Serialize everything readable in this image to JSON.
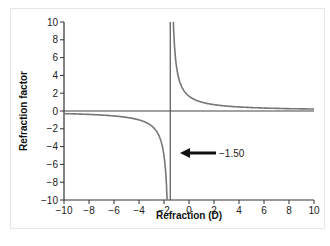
{
  "chart_data": {
    "type": "line",
    "title": "",
    "xlabel": "Refraction (D)",
    "ylabel": "Refraction factor",
    "xlim": [
      -10,
      10
    ],
    "ylim": [
      -10,
      10
    ],
    "x_ticks": [
      -10,
      -8,
      -6,
      -4,
      -2,
      0,
      2,
      4,
      6,
      8,
      10
    ],
    "y_ticks": [
      10,
      8,
      6,
      4,
      2,
      0,
      -2,
      -4,
      -6,
      -8,
      -10
    ],
    "grid": false,
    "legend": null,
    "vertical_asymptote": -1.5,
    "annotations": [
      {
        "text": "−1.50",
        "arrow_points_to_x": -1.5,
        "y": -4
      }
    ],
    "series": [
      {
        "name": "Refraction factor",
        "formula": "2.5 / (D + 1.5)",
        "x": [
          -10,
          -8,
          -6,
          -4,
          -3,
          -2.5,
          -2,
          -1.75,
          -1.25,
          -1,
          -0.5,
          0,
          1,
          2,
          4,
          6,
          8,
          10
        ],
        "values": [
          -0.29,
          -0.38,
          -0.56,
          -1.0,
          -1.67,
          -2.5,
          -5.0,
          -10.0,
          10.0,
          5.0,
          2.5,
          1.67,
          1.0,
          0.71,
          0.45,
          0.33,
          0.26,
          0.22
        ]
      }
    ]
  },
  "labels": {
    "xlabel": "Refraction (D)",
    "ylabel": "Refraction factor",
    "annotation": "−1.50",
    "x_ticks": [
      "−10",
      "−8",
      "−6",
      "−4",
      "−2",
      "0",
      "2",
      "4",
      "6",
      "8",
      "10"
    ],
    "y_ticks": [
      "10",
      "8",
      "6",
      "4",
      "2",
      "0",
      "−2",
      "−4",
      "−6",
      "−8",
      "−10"
    ]
  },
  "colors": {
    "axis": "#333333",
    "curve": "#777777",
    "asymptote": "#555555",
    "arrow": "#111111"
  }
}
